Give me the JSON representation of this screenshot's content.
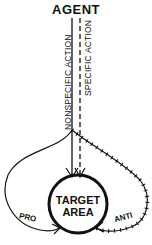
{
  "diagram": {
    "title": "AGENT",
    "paths": {
      "nonspecific": "NONSPECIFIC ACTION",
      "specific": "SPECIFIC ACTION"
    },
    "target": {
      "line1": "TARGET",
      "line2": "AREA"
    },
    "loops": {
      "pro": "PRO",
      "anti": "ANTI"
    },
    "colors": {
      "ink": "#111111",
      "background": "#ffffff"
    }
  }
}
